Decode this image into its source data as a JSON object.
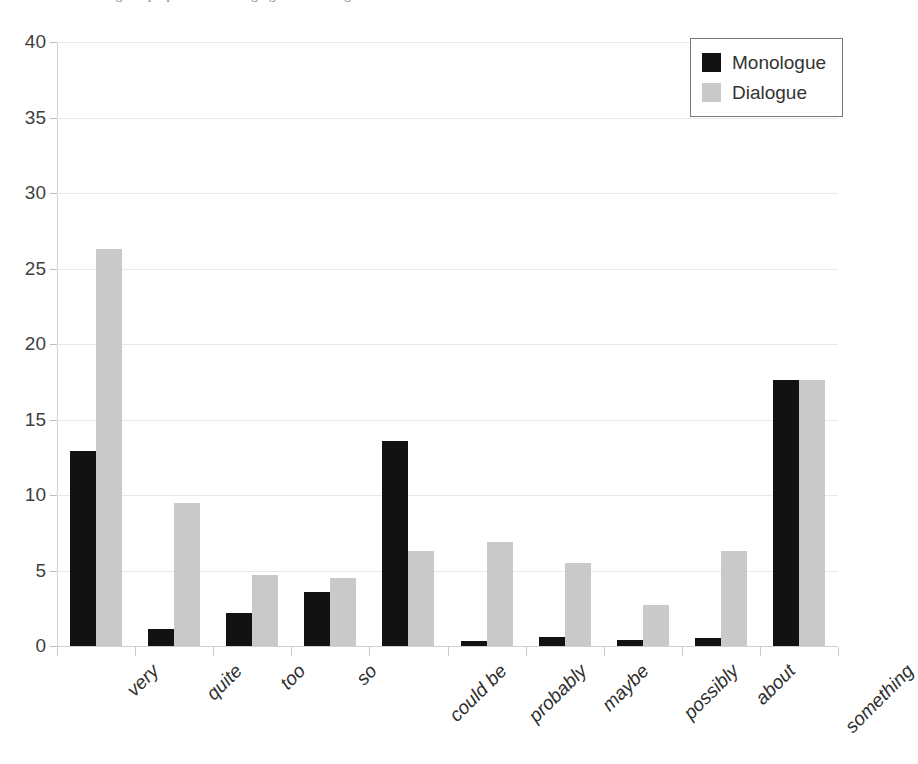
{
  "caption": {
    "remnant_text": "Figure: proportions of hedging and boosting devices"
  },
  "legend": {
    "position": "top-right",
    "entries": [
      {
        "label": "Monologue",
        "color": "#121212",
        "swatch_icon": "filled-square-icon"
      },
      {
        "label": "Dialogue",
        "color": "#c9c9c9",
        "swatch_icon": "filled-square-icon"
      }
    ]
  },
  "axes": {
    "y_ticks": [
      "0",
      "5",
      "10",
      "15",
      "20",
      "25",
      "30",
      "35",
      "40"
    ],
    "x_ticks": [
      "very",
      "quite",
      "too",
      "so",
      "could be",
      "probably",
      "maybe",
      "possibly",
      "about",
      "something"
    ]
  },
  "chart_data": {
    "type": "bar",
    "title": "",
    "subtitle": "",
    "xlabel": "",
    "ylabel": "",
    "ylim": [
      0,
      40
    ],
    "ytick_step": 5,
    "grid": true,
    "legend_position": "top-right",
    "categories": [
      "very",
      "quite",
      "too",
      "so",
      "could be",
      "probably",
      "maybe",
      "possibly",
      "about",
      "something"
    ],
    "series": [
      {
        "name": "Monologue",
        "color": "#121212",
        "values": [
          12.9,
          1.1,
          2.2,
          3.6,
          13.6,
          0.35,
          0.6,
          0.4,
          0.5,
          17.6
        ]
      },
      {
        "name": "Dialogue",
        "color": "#c9c9c9",
        "values": [
          26.3,
          9.5,
          4.7,
          4.5,
          6.3,
          6.9,
          5.5,
          2.7,
          6.3,
          17.6
        ]
      }
    ]
  }
}
